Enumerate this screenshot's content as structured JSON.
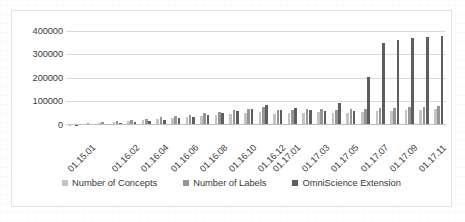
{
  "chart_data": {
    "type": "bar",
    "title": "",
    "subtitle": "",
    "xlabel": "",
    "ylabel": "",
    "ylim": [
      0,
      450000
    ],
    "grid": true,
    "legend_position": "bottom",
    "y_ticks": [
      "0",
      "100000",
      "200000",
      "300000",
      "400000"
    ],
    "y_tick_values": [
      0,
      100000,
      200000,
      300000,
      400000
    ],
    "categories": [
      "01.15.01",
      "01.15.02",
      "01.16.01",
      "01.16.02",
      "01.16.03",
      "01.16.04",
      "01.16.05",
      "01.16.06",
      "01.16.07",
      "01.16.08",
      "01.16.09",
      "01.16.10",
      "01.16.11",
      "01.16.12",
      "01.17.01",
      "01.17.02",
      "01.17.03",
      "01.17.04",
      "01.17.05",
      "01.17.06",
      "01.17.07",
      "01.17.08",
      "01.17.09",
      "01.17.10",
      "01.17.11",
      "01.17.12"
    ],
    "visible_tick_labels": [
      "01.15.01",
      "01.16.02",
      "01.16.04",
      "01.16.06",
      "01.16.08",
      "01.16.10",
      "01.16.12",
      "01.17.01",
      "01.17.03",
      "01.17.05",
      "01.17.07",
      "01.17.09",
      "01.17.11"
    ],
    "visible_tick_indices": [
      0,
      3,
      5,
      7,
      9,
      11,
      13,
      14,
      16,
      18,
      20,
      22,
      24
    ],
    "series": [
      {
        "name": "Number of Concepts",
        "color": "#c3c3c3",
        "values": [
          2000,
          6000,
          9000,
          12000,
          16000,
          20000,
          26000,
          30000,
          34000,
          38000,
          42000,
          46000,
          50000,
          56000,
          48000,
          50000,
          52000,
          54000,
          50000,
          52000,
          56000,
          58000,
          60000,
          62000,
          64000,
          66000
        ]
      },
      {
        "name": "Number of Labels",
        "color": "#959595",
        "values": [
          3000,
          8000,
          12000,
          16000,
          21000,
          26000,
          32000,
          38000,
          44000,
          50000,
          56000,
          62000,
          68000,
          76000,
          62000,
          64000,
          66000,
          68000,
          64000,
          66000,
          70000,
          72000,
          74000,
          76000,
          78000,
          80000
        ]
      },
      {
        "name": "OmniScience Extension",
        "color": "#5e5e5e",
        "values": [
          1000,
          3000,
          5000,
          8000,
          12000,
          16000,
          22000,
          28000,
          34000,
          42000,
          50000,
          60000,
          70000,
          86000,
          62000,
          72000,
          62000,
          58000,
          92000,
          60000,
          205000,
          350000,
          362000,
          368000,
          375000,
          380000
        ]
      }
    ]
  },
  "legend": {
    "items": [
      {
        "label": "Number of Concepts",
        "swatch": "legend-swatch-concepts"
      },
      {
        "label": "Number of Labels",
        "swatch": "legend-swatch-labels"
      },
      {
        "label": "OmniScience Extension",
        "swatch": "legend-swatch-omniscience"
      }
    ]
  }
}
